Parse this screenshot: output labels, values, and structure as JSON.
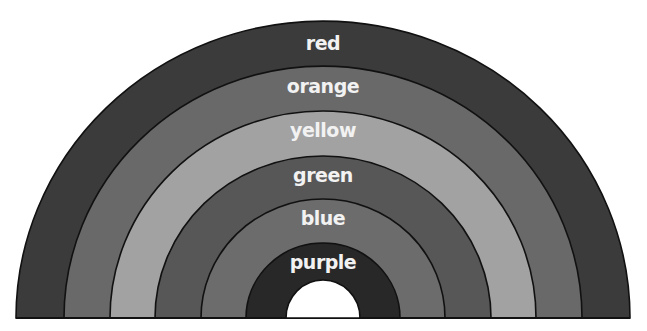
{
  "diagram": {
    "type": "rainbow-arc",
    "center_x": 323,
    "baseline_y": 318,
    "bands": [
      {
        "name": "red",
        "label": "red",
        "outer_rx": 307,
        "outer_ry": 297,
        "color": "#3b3b3b",
        "label_y": 50
      },
      {
        "name": "orange",
        "label": "orange",
        "outer_rx": 259,
        "outer_ry": 252,
        "color": "#696969",
        "label_y": 108
      },
      {
        "name": "yellow",
        "label": "yellow",
        "outer_rx": 213,
        "outer_ry": 207,
        "color": "#a2a2a2",
        "label_y": 163
      },
      {
        "name": "green",
        "label": "green",
        "outer_rx": 168,
        "outer_ry": 162,
        "color": "#575757",
        "label_y": 221
      },
      {
        "name": "blue",
        "label": "blue",
        "outer_rx": 122,
        "outer_ry": 119,
        "color": "#6c6c6c",
        "label_y": 272
      },
      {
        "name": "purple",
        "label": "purple",
        "outer_rx": 77,
        "outer_ry": 75,
        "color": "#282828",
        "label_y": 327
      }
    ],
    "hole": {
      "rx": 37,
      "ry": 38,
      "color": "#ffffff"
    },
    "outline_color": "#111111",
    "label_color": "#f2f2f2"
  }
}
